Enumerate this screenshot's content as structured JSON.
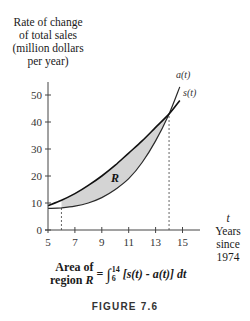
{
  "chart_data": {
    "type": "line",
    "title": "",
    "ylabel": "Rate of change of total sales (million dollars per year)",
    "xlabel": "t Years since 1974",
    "x": [
      5,
      6,
      7,
      8,
      9,
      10,
      11,
      12,
      13,
      14,
      14.8
    ],
    "series": [
      {
        "name": "a(t)",
        "values": [
          8,
          8.2,
          8.8,
          10,
          12,
          15,
          19,
          25,
          33,
          43,
          53
        ]
      },
      {
        "name": "s(t)",
        "values": [
          9,
          11,
          13.5,
          16.5,
          20,
          24,
          28.5,
          33,
          38,
          43,
          48
        ]
      }
    ],
    "xlim": [
      5,
      16.5
    ],
    "ylim": [
      0,
      55
    ],
    "xticks": [
      5,
      7,
      9,
      11,
      13,
      15
    ],
    "yticks": [
      0,
      10,
      20,
      30,
      40,
      50
    ],
    "shaded_region": {
      "label": "R",
      "between": [
        "s(t)",
        "a(t)"
      ],
      "from": 6,
      "to": 14
    },
    "annotations": [
      "dashed vertical line at t = 6",
      "dashed vertical line at t = 14"
    ],
    "grid": false,
    "legend": "inline curve labels"
  },
  "axes": {
    "ylabel_lines": [
      "Rate of change",
      "of total sales",
      "(million dollars",
      "per year)"
    ],
    "xlabel_var": "t",
    "xlabel_lines": [
      "Years",
      "since",
      "1974"
    ],
    "xtick_labels": [
      "5",
      "7",
      "9",
      "11",
      "13",
      "15"
    ],
    "ytick_labels": [
      "0",
      "10",
      "20",
      "30",
      "40",
      "50"
    ]
  },
  "labels": {
    "a_curve": "a(t)",
    "s_curve": "s(t)",
    "region": "R"
  },
  "formula": {
    "lhs_line1": "Area of",
    "lhs_line2_text": "region ",
    "lhs_line2_var": "R",
    "equals": "=",
    "integral": "∫",
    "upper": "14",
    "lower": "6",
    "integrand": "[s(t) - a(t)] dt"
  },
  "caption": "FIGURE 7.6",
  "colors": {
    "fill": "#d4d4d4",
    "curve": "#1a1a1a",
    "axis": "#444444"
  }
}
